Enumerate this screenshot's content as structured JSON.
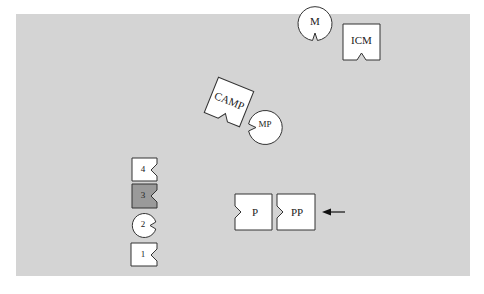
{
  "diagram": {
    "nodes": [
      {
        "id": "M",
        "label": "M",
        "shape": "circle-notch-bottom"
      },
      {
        "id": "ICM",
        "label": "ICM",
        "shape": "square-notch-bottom"
      },
      {
        "id": "CAMP",
        "label": "CAMP",
        "shape": "square-notch-bottom-rotated"
      },
      {
        "id": "MP",
        "label": "MP",
        "shape": "circle-notch-left"
      },
      {
        "id": "4",
        "label": "4",
        "shape": "square-notch-right"
      },
      {
        "id": "3",
        "label": "3",
        "shape": "square-notch-right",
        "fill": "#9a9a9a"
      },
      {
        "id": "2",
        "label": "2",
        "shape": "circle-notch-right"
      },
      {
        "id": "1",
        "label": "1",
        "shape": "square-notch-right"
      },
      {
        "id": "P",
        "label": "P",
        "shape": "square-notch-left"
      },
      {
        "id": "PP",
        "label": "PP",
        "shape": "square-notch-left"
      }
    ],
    "arrow": {
      "points_to": "PP",
      "direction": "left"
    }
  }
}
